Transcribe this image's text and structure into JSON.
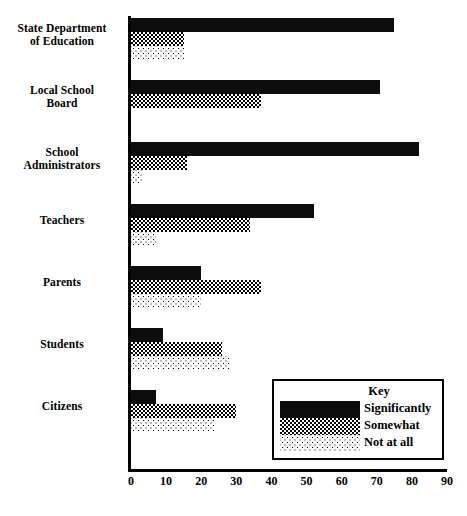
{
  "chart_data": {
    "type": "bar",
    "orientation": "horizontal",
    "title": "",
    "xlabel": "",
    "ylabel": "",
    "xlim": [
      0,
      90
    ],
    "xticks": [
      0,
      10,
      20,
      30,
      40,
      50,
      60,
      70,
      80,
      90
    ],
    "grid": false,
    "legend": {
      "title": "Key",
      "position": "bottom-right",
      "entries": [
        {
          "label": "Significantly",
          "pattern": "solid-black",
          "color": "#0d0d0d"
        },
        {
          "label": "Somewhat",
          "pattern": "dense-checkerboard",
          "color": "#000000"
        },
        {
          "label": "Not at all",
          "pattern": "sparse-dots",
          "color": "#000000"
        }
      ]
    },
    "categories": [
      "State Department of Education",
      "Local School Board",
      "School Administrators",
      "Teachers",
      "Parents",
      "Students",
      "Citizens"
    ],
    "category_lines": [
      [
        "State Department",
        "of Education"
      ],
      [
        "Local School",
        "Board"
      ],
      [
        "School",
        "Administrators"
      ],
      [
        "Teachers"
      ],
      [
        "Parents"
      ],
      [
        "Students"
      ],
      [
        "Citizens"
      ]
    ],
    "series": [
      {
        "name": "Significantly",
        "values": [
          75,
          71,
          82,
          52,
          20,
          9,
          7
        ]
      },
      {
        "name": "Somewhat",
        "values": [
          15,
          37,
          16,
          34,
          37,
          26,
          30
        ]
      },
      {
        "name": "Not at all",
        "values": [
          15,
          0,
          3,
          7,
          20,
          28,
          24
        ]
      }
    ]
  },
  "axis": {
    "tick_labels": [
      "0",
      "10",
      "20",
      "30",
      "40",
      "50",
      "60",
      "70",
      "80",
      "90"
    ]
  }
}
